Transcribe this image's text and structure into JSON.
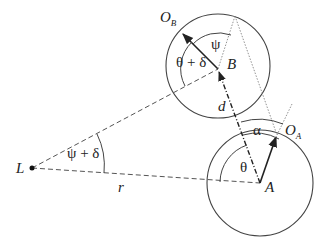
{
  "diagram": {
    "type": "geometry",
    "points": {
      "L": {
        "label": "L",
        "x": 32,
        "y": 168
      },
      "A": {
        "label": "A",
        "x": 260,
        "y": 183
      },
      "B": {
        "label": "B",
        "x": 218,
        "y": 69
      },
      "O_A": {
        "label": "O",
        "sub": "A",
        "x": 277,
        "y": 135
      },
      "O_B": {
        "label": "O",
        "sub": "B",
        "x": 181,
        "y": 32
      }
    },
    "circles": [
      {
        "name": "circle-A",
        "cx": 260,
        "cy": 183,
        "r": 53
      },
      {
        "name": "circle-B",
        "cx": 218,
        "cy": 66,
        "r": 52
      }
    ],
    "labels": {
      "L": "L",
      "A": "A",
      "B": "B",
      "O": "O",
      "O_A_sub": "A",
      "O_B_sub": "B",
      "r": "r",
      "d": "d",
      "alpha": "α",
      "theta": "θ",
      "psi": "ψ",
      "theta_plus_delta": "θ + δ",
      "psi_plus_delta": "ψ + δ"
    },
    "stroke_color": "#333333"
  }
}
